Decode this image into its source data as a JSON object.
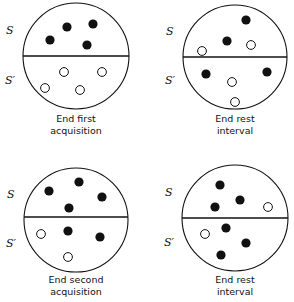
{
  "panels": [
    {
      "id": "end-first-acquisition",
      "caption_line1": "End first",
      "caption_line2": "acquisition",
      "label_top": "S",
      "label_bottom": "S′",
      "circle": {
        "cx": 76,
        "cy": 56,
        "r": 53
      },
      "divider_y": 56,
      "caption_y": 122,
      "filled": [
        [
          50,
          40
        ],
        [
          67,
          27
        ],
        [
          93,
          24
        ],
        [
          87,
          45
        ]
      ],
      "open": [
        [
          64,
          72
        ],
        [
          102,
          72
        ],
        [
          45,
          88
        ],
        [
          80,
          90
        ]
      ]
    },
    {
      "id": "end-rest-interval-1",
      "caption_line1": "End rest",
      "caption_line2": "interval",
      "label_top": "S",
      "label_bottom": "S′",
      "circle": {
        "cx": 235,
        "cy": 57,
        "r": 52
      },
      "divider_y": 57,
      "caption_y": 122,
      "filled": [
        [
          246,
          20
        ],
        [
          227,
          41
        ],
        [
          206,
          74
        ],
        [
          267,
          72
        ]
      ],
      "open": [
        [
          202,
          51
        ],
        [
          251,
          45
        ],
        [
          232,
          82
        ],
        [
          235,
          102
        ]
      ]
    },
    {
      "id": "end-second-acquisition",
      "caption_line1": "End second",
      "caption_line2": "acquisition",
      "label_top": "S",
      "label_bottom": "S′",
      "circle": {
        "cx": 76,
        "cy": 220,
        "r": 52
      },
      "divider_y": 217,
      "caption_y": 283,
      "filled": [
        [
          49,
          191
        ],
        [
          79,
          182
        ],
        [
          102,
          197
        ],
        [
          69,
          208
        ],
        [
          68,
          231
        ],
        [
          100,
          237
        ]
      ],
      "open": [
        [
          41,
          234
        ],
        [
          68,
          257
        ]
      ]
    },
    {
      "id": "end-rest-interval-2",
      "caption_line1": "End rest",
      "caption_line2": "interval",
      "label_top": "S",
      "label_bottom": "S′",
      "circle": {
        "cx": 235,
        "cy": 218,
        "r": 53
      },
      "divider_y": 218,
      "caption_y": 283,
      "filled": [
        [
          220,
          185
        ],
        [
          240,
          200
        ],
        [
          215,
          207
        ],
        [
          226,
          228
        ],
        [
          246,
          243
        ],
        [
          221,
          255
        ]
      ],
      "open": [
        [
          268,
          207
        ],
        [
          205,
          234
        ]
      ]
    }
  ],
  "legend": {
    "filled_marker": "filled circle",
    "open_marker": "open circle"
  },
  "colors": {
    "ink": "#111111",
    "paper": "#ffffff"
  }
}
